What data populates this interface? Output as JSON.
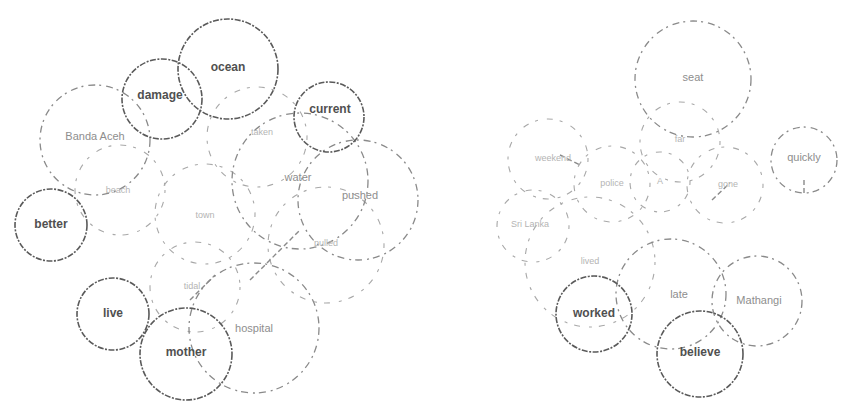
{
  "diagram": {
    "type": "word-bubble-clusters",
    "clusters": [
      {
        "id": "left",
        "bubbles": [
          {
            "word": "ocean",
            "cx": 228,
            "cy": 69,
            "r": 50,
            "style": "solid"
          },
          {
            "word": "damage",
            "cx": 162,
            "cy": 99,
            "r": 40,
            "style": "solid"
          },
          {
            "word": "current",
            "cx": 329,
            "cy": 117,
            "r": 35,
            "style": "solid"
          },
          {
            "word": "Banda Aceh",
            "cx": 95,
            "cy": 140,
            "r": 55,
            "style": "faded"
          },
          {
            "word": "water",
            "cx": 300,
            "cy": 181,
            "r": 68,
            "style": "faded"
          },
          {
            "word": "pushed",
            "cx": 358,
            "cy": 200,
            "r": 60,
            "style": "faded"
          },
          {
            "word": "pulled",
            "cx": 326,
            "cy": 245,
            "r": 58,
            "style": "ghost"
          },
          {
            "word": "better",
            "cx": 51,
            "cy": 225,
            "r": 36,
            "style": "solid"
          },
          {
            "word": "taken",
            "cx": 257,
            "cy": 137,
            "r": 50,
            "style": "ghost"
          },
          {
            "word": "town",
            "cx": 205,
            "cy": 214,
            "r": 50,
            "style": "ghost"
          },
          {
            "word": "beach",
            "cx": 120,
            "cy": 190,
            "r": 45,
            "style": "ghost"
          },
          {
            "word": "tidal",
            "cx": 195,
            "cy": 287,
            "r": 45,
            "style": "ghost"
          },
          {
            "word": "live",
            "cx": 113,
            "cy": 314,
            "r": 36,
            "style": "solid"
          },
          {
            "word": "mother",
            "cx": 186,
            "cy": 354,
            "r": 46,
            "style": "solid"
          },
          {
            "word": "hospital",
            "cx": 254,
            "cy": 328,
            "r": 65,
            "style": "faded"
          }
        ]
      },
      {
        "id": "right",
        "bubbles": [
          {
            "word": "seat",
            "cx": 693,
            "cy": 79,
            "r": 58,
            "style": "faded"
          },
          {
            "word": "far",
            "cx": 680,
            "cy": 142,
            "r": 40,
            "style": "ghost"
          },
          {
            "word": "quickly",
            "cx": 804,
            "cy": 160,
            "r": 33,
            "style": "faded"
          },
          {
            "word": "weekend",
            "cx": 548,
            "cy": 159,
            "r": 40,
            "style": "ghost"
          },
          {
            "word": "police",
            "cx": 612,
            "cy": 184,
            "r": 38,
            "style": "ghost"
          },
          {
            "word": "A",
            "cx": 660,
            "cy": 182,
            "r": 30,
            "style": "ghost"
          },
          {
            "word": "gone",
            "cx": 725,
            "cy": 185,
            "r": 38,
            "style": "ghost"
          },
          {
            "word": "Sri Lanka",
            "cx": 533,
            "cy": 226,
            "r": 36,
            "style": "ghost"
          },
          {
            "word": "lived",
            "cx": 590,
            "cy": 262,
            "r": 65,
            "style": "ghost"
          },
          {
            "word": "late",
            "cx": 671,
            "cy": 294,
            "r": 55,
            "style": "faded"
          },
          {
            "word": "Mathangi",
            "cx": 757,
            "cy": 301,
            "r": 45,
            "style": "faded"
          },
          {
            "word": "worked",
            "cx": 594,
            "cy": 314,
            "r": 38,
            "style": "solid"
          },
          {
            "word": "believe",
            "cx": 700,
            "cy": 354,
            "r": 43,
            "style": "solid"
          }
        ]
      }
    ]
  },
  "labels": {
    "ocean": "ocean",
    "damage": "damage",
    "current": "current",
    "banda_aceh": "Banda Aceh",
    "water": "water",
    "pushed": "pushed",
    "pulled": "pulled",
    "better": "better",
    "taken": "taken",
    "town": "town",
    "beach": "beach",
    "tidal": "tidal",
    "live": "live",
    "mother": "mother",
    "hospital": "hospital",
    "seat": "seat",
    "far": "far",
    "quickly": "quickly",
    "weekend": "weekend",
    "police": "police",
    "a": "A",
    "gone": "gone",
    "sri_lanka": "Sri Lanka",
    "lived": "lived",
    "late": "late",
    "mathangi": "Mathangi",
    "worked": "worked",
    "believe": "believe"
  }
}
